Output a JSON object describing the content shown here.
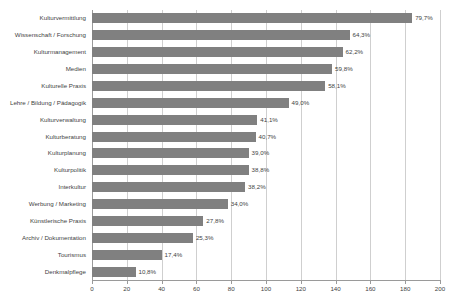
{
  "chart_data": {
    "type": "bar",
    "orientation": "horizontal",
    "title": "",
    "subtitle": "",
    "xlabel": "",
    "ylabel": "",
    "xlim": [
      0,
      200
    ],
    "grid": true,
    "legend": null,
    "xticks": [
      0,
      20,
      40,
      60,
      80,
      100,
      120,
      140,
      160,
      180,
      200
    ],
    "xtick_labels": [
      "0",
      "20",
      "40",
      "60",
      "80",
      "100",
      "120",
      "140",
      "160",
      "180",
      "200"
    ],
    "categories": [
      "Kulturvermittlung",
      "Wissenschaft / Forschung",
      "Kulturmanagement",
      "Medien",
      "Kulturelle Praxis",
      "Lehre / Bildung / Pädagogik",
      "Kulturverwaltung",
      "Kulturberatung",
      "Kulturplanung",
      "Kulturpolitik",
      "Interkultur",
      "Werbung / Marketing",
      "Künstlerische Praxis",
      "Archiv / Dokumentation",
      "Tourismus",
      "Denkmalpflege"
    ],
    "values": [
      184,
      148,
      144,
      138,
      134,
      113,
      95,
      94,
      90,
      90,
      88,
      78,
      64,
      58,
      40,
      25
    ],
    "data_labels": [
      "79,7%",
      "64,3%",
      "62,2%",
      "59,8%",
      "58,1%",
      "49,0%",
      "41,1%",
      "40,7%",
      "39,0%",
      "38,8%",
      "38,2%",
      "34,0%",
      "27,8%",
      "25,3%",
      "17,4%",
      "10,8%"
    ],
    "percent_values": [
      79.7,
      64.3,
      62.2,
      59.8,
      58.1,
      49.0,
      41.1,
      40.7,
      39.0,
      38.8,
      38.2,
      34.0,
      27.8,
      25.3,
      17.4,
      10.8
    ]
  },
  "style": {
    "bar_color": "#808080",
    "grid_color": "#cfcfcf",
    "axis_color": "#9a9a9a",
    "text_color": "#3f3f3f",
    "background": "#ffffff"
  }
}
